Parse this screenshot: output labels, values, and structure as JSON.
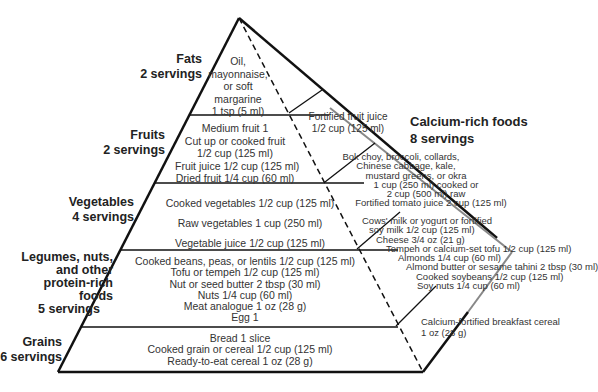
{
  "left_labels": [
    {
      "name": "Fats",
      "servings": "2 servings"
    },
    {
      "name": "Fruits",
      "servings": "2 servings"
    },
    {
      "name": "Vegetables",
      "servings": "4 servings"
    },
    {
      "name_lines": [
        "Legumes, nuts,",
        "and other",
        "protein-rich",
        "foods"
      ],
      "servings": "5 servings"
    },
    {
      "name": "Grains",
      "servings": "6 servings"
    }
  ],
  "tiers": {
    "fats": [
      "Oil,",
      "mayonnaise,",
      "or soft",
      "margarine",
      "1 tsp (5 ml)"
    ],
    "fruits": [
      "Medium fruit 1",
      "Cut up or cooked fruit",
      "1/2 cup (125 ml)",
      "Fruit juice  1/2 cup (125 ml)",
      "Dried fruit  1/4 cup (60 ml)"
    ],
    "vegetables": [
      "Cooked vegetables  1/2 cup (125 ml)",
      "Raw vegetables  1 cup (250 ml)",
      "Vegetable juice  1/2 cup (125 ml)"
    ],
    "legumes": [
      "Cooked beans, peas, or lentils  1/2 cup (125 ml)",
      "Tofu or tempeh  1/2 cup (125 ml)",
      "Nut or seed butter  2 tbsp (30 ml)",
      "Nuts  1/4 cup (60 ml)",
      "Meat analogue  1 oz (28 g)",
      "Egg  1"
    ],
    "grains": [
      "Bread  1 slice",
      "Cooked grain or cereal  1/2 cup (125 ml)",
      "Ready-to-eat cereal  1 oz (28 g)"
    ]
  },
  "calcium": {
    "title": "Calcium-rich foods",
    "servings": "8 servings",
    "fruits_side": [
      "Fortified fruit juice",
      "1/2 cup (125 ml)"
    ],
    "veg_side": [
      "Bok choy, broccoli, collards,",
      "Chinese cabbage, kale,",
      "mustard greens, or okra",
      "1 cup (250 ml) cooked or",
      "2 cup (500 ml) raw",
      "Fortified tomato juice 2 cup (125 ml)"
    ],
    "legume_side": [
      "Cows' milk or yogurt or fortified",
      "soy milk  1/2 cup (125 ml)",
      "Cheese  3/4 oz (21 g)",
      "Tempeh or calcium-set tofu  1/2 cup (125 ml)",
      "Almonds 1/4 cup (60 ml)",
      "Almond butter or sesame tahini  2 tbsp (30 ml)",
      "Cooked soybeans  1/2 cup (125 ml)",
      "Soy nuts  1/4 cup (60 ml)"
    ],
    "grain_side": [
      "Calcium-fortified breakfast cereal",
      "1 oz (28 g)"
    ]
  }
}
